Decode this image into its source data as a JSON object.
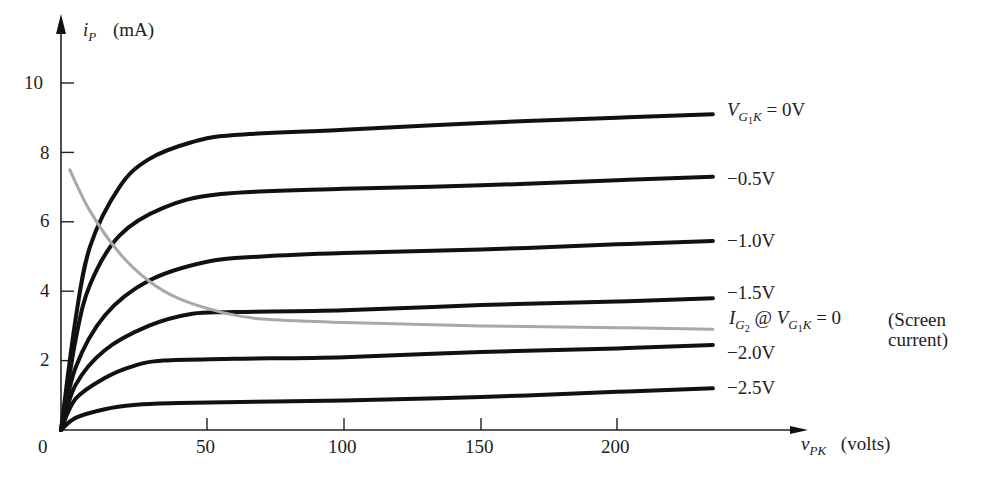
{
  "chart_data": {
    "type": "line",
    "title": "",
    "xlabel": "v_PK (volts)",
    "ylabel": "i_P (mA)",
    "xlim": [
      0,
      235
    ],
    "ylim": [
      0,
      11
    ],
    "grid": false,
    "x_ticks": [
      0,
      50,
      100,
      150,
      200
    ],
    "y_ticks": [
      2,
      4,
      6,
      8,
      10
    ],
    "series": [
      {
        "name": "V_G1K = 0V",
        "color": "#111111",
        "points": [
          [
            0,
            0
          ],
          [
            5,
            3.2
          ],
          [
            10,
            5.3
          ],
          [
            20,
            7.0
          ],
          [
            30,
            7.8
          ],
          [
            45,
            8.3
          ],
          [
            60,
            8.5
          ],
          [
            100,
            8.65
          ],
          [
            150,
            8.85
          ],
          [
            200,
            9.0
          ],
          [
            235,
            9.1
          ]
        ]
      },
      {
        "name": "-0.5V",
        "color": "#111111",
        "points": [
          [
            0,
            0
          ],
          [
            5,
            2.6
          ],
          [
            10,
            4.2
          ],
          [
            20,
            5.6
          ],
          [
            35,
            6.4
          ],
          [
            55,
            6.8
          ],
          [
            100,
            6.95
          ],
          [
            150,
            7.05
          ],
          [
            200,
            7.2
          ],
          [
            235,
            7.3
          ]
        ]
      },
      {
        "name": "-1.0V",
        "color": "#111111",
        "points": [
          [
            0,
            0
          ],
          [
            5,
            1.8
          ],
          [
            15,
            3.3
          ],
          [
            30,
            4.3
          ],
          [
            50,
            4.85
          ],
          [
            70,
            5.0
          ],
          [
            100,
            5.1
          ],
          [
            150,
            5.2
          ],
          [
            200,
            5.35
          ],
          [
            235,
            5.45
          ]
        ]
      },
      {
        "name": "-1.5V",
        "color": "#111111",
        "points": [
          [
            0,
            0
          ],
          [
            5,
            1.3
          ],
          [
            15,
            2.3
          ],
          [
            30,
            3.0
          ],
          [
            45,
            3.35
          ],
          [
            60,
            3.4
          ],
          [
            100,
            3.45
          ],
          [
            150,
            3.6
          ],
          [
            200,
            3.7
          ],
          [
            235,
            3.8
          ]
        ]
      },
      {
        "name": "-2.0V",
        "color": "#111111",
        "points": [
          [
            0,
            0
          ],
          [
            5,
            0.9
          ],
          [
            15,
            1.5
          ],
          [
            25,
            1.85
          ],
          [
            35,
            2.0
          ],
          [
            60,
            2.05
          ],
          [
            100,
            2.1
          ],
          [
            150,
            2.25
          ],
          [
            200,
            2.35
          ],
          [
            235,
            2.45
          ]
        ]
      },
      {
        "name": "-2.5V",
        "color": "#111111",
        "points": [
          [
            0,
            0
          ],
          [
            5,
            0.35
          ],
          [
            15,
            0.6
          ],
          [
            25,
            0.72
          ],
          [
            40,
            0.78
          ],
          [
            100,
            0.85
          ],
          [
            150,
            0.95
          ],
          [
            200,
            1.1
          ],
          [
            235,
            1.2
          ]
        ]
      },
      {
        "name": "I_G2 @ V_G1K = 0 (Screen current)",
        "color": "#a8a8a8",
        "points": [
          [
            3,
            7.5
          ],
          [
            10,
            6.3
          ],
          [
            20,
            5.1
          ],
          [
            30,
            4.3
          ],
          [
            40,
            3.8
          ],
          [
            55,
            3.4
          ],
          [
            70,
            3.2
          ],
          [
            100,
            3.1
          ],
          [
            150,
            3.0
          ],
          [
            200,
            2.95
          ],
          [
            235,
            2.9
          ]
        ]
      }
    ],
    "annotations": [
      "V_G1K = 0V",
      "-0.5V",
      "-1.0V",
      "-1.5V",
      "-2.0V",
      "-2.5V",
      "I_G2 @ V_G1K = 0 (Screen current)"
    ]
  },
  "axes": {
    "y_var": "i",
    "y_sub": "P",
    "y_unit": "(mA)",
    "x_var": "v",
    "x_sub": "PK",
    "x_unit": "(volts)",
    "origin": "0",
    "y_tick_labels": [
      "10",
      "8",
      "6",
      "4",
      "2"
    ],
    "x_tick_labels": [
      "50",
      "100",
      "150",
      "200"
    ]
  },
  "labels": {
    "v0_var": "V",
    "v0_sub": "G",
    "v0_subsub": "1",
    "v0_k": "K",
    "v0_eq": " = 0V",
    "m05": "−0.5V",
    "m10": "−1.0V",
    "m15": "−1.5V",
    "m20": "−2.0V",
    "m25": "−2.5V",
    "sc_i": "I",
    "sc_sub": "G",
    "sc_subsub": "2",
    "sc_at": " @ ",
    "sc_v": "V",
    "sc_vsub": "G",
    "sc_vsubsub": "1",
    "sc_k": "K",
    "sc_eq": " = 0",
    "sc_note1": "(Screen",
    "sc_note2": "current)"
  }
}
